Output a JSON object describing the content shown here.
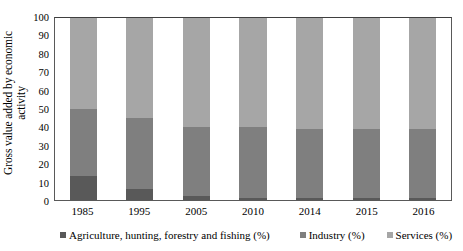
{
  "chart_data": {
    "type": "bar",
    "subtype": "stacked-100-percent",
    "title": "",
    "xlabel": "",
    "ylabel": "Gross value added by economic activity",
    "ylabel_line1": "Gross value added by economic",
    "ylabel_line2": "activity",
    "ylim": [
      0,
      100
    ],
    "ytick_step": 10,
    "yticks": [
      100,
      90,
      80,
      70,
      60,
      50,
      40,
      30,
      20,
      10,
      0
    ],
    "grid": false,
    "legend_position": "bottom",
    "categories": [
      "1985",
      "1995",
      "2005",
      "2010",
      "2014",
      "2015",
      "2016"
    ],
    "series": [
      {
        "name": "Agriculture, hunting, forestry and fishing (%)",
        "color": "#595959",
        "values": [
          13,
          6,
          2,
          1,
          1,
          1,
          1
        ]
      },
      {
        "name": "Industry (%)",
        "color": "#7f7f7f",
        "values": [
          37,
          39,
          38,
          39,
          38,
          38,
          38
        ]
      },
      {
        "name": "Services (%)",
        "color": "#a6a6a6",
        "values": [
          50,
          55,
          60,
          60,
          61,
          61,
          61
        ]
      }
    ],
    "cumulative_tops": {
      "agriculture": [
        13,
        6,
        2,
        1,
        1,
        1,
        1
      ],
      "industry": [
        50,
        45,
        40,
        40,
        39,
        39,
        39
      ],
      "services": [
        100,
        100,
        100,
        100,
        100,
        100,
        100
      ]
    }
  },
  "axis": {
    "y_title_line1": "Gross value added by economic",
    "y_title_line2": "activity",
    "y_ticks": [
      "100",
      "90",
      "80",
      "70",
      "60",
      "50",
      "40",
      "30",
      "20",
      "10",
      "0"
    ],
    "x_labels": [
      "1985",
      "1995",
      "2005",
      "2010",
      "2014",
      "2015",
      "2016"
    ]
  },
  "legend": {
    "items": [
      {
        "label": "Agriculture, hunting, forestry and fishing (%)",
        "color": "#595959"
      },
      {
        "label": "Industry (%)",
        "color": "#7f7f7f"
      },
      {
        "label": "Services (%)",
        "color": "#a6a6a6"
      }
    ]
  },
  "colors": {
    "agriculture": "#595959",
    "industry": "#7f7f7f",
    "services": "#a6a6a6",
    "axis": "#595959",
    "background": "#ffffff",
    "text": "#000000"
  }
}
